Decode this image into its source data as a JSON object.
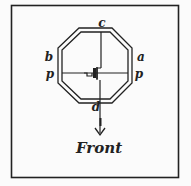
{
  "diagram": {
    "colors": {
      "line": "#222222",
      "background": "#fbfbfb"
    },
    "labels": {
      "top": "c",
      "upper_left": "b",
      "upper_right": "a",
      "left_axis": "p",
      "right_axis": "p",
      "bottom": "d",
      "direction": "Front"
    },
    "elements": [
      {
        "name": "outer-frame",
        "type": "rectangle"
      },
      {
        "name": "octagon-outer",
        "type": "octagon"
      },
      {
        "name": "octagon-inner",
        "type": "octagon"
      },
      {
        "name": "horizontal-axis-p-p",
        "type": "line"
      },
      {
        "name": "vertical-axis-c-d",
        "type": "line"
      },
      {
        "name": "center-mark",
        "type": "symbol"
      },
      {
        "name": "front-arrow",
        "type": "arrow",
        "direction": "down"
      }
    ]
  }
}
